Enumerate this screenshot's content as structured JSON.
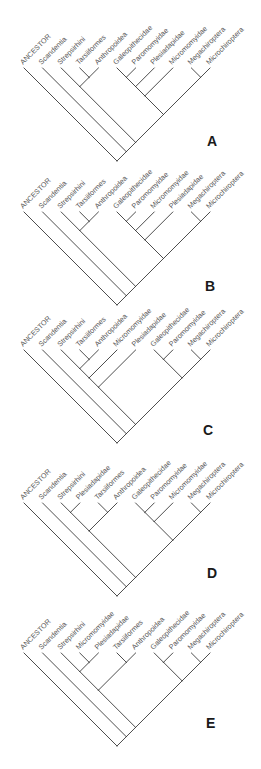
{
  "figure": {
    "colors": {
      "line": "#3a3a3a",
      "label": "#555555",
      "letter": "#1a1a1a",
      "background": "#ffffff"
    }
  },
  "panels": [
    {
      "letter": "A",
      "top": 0,
      "tip_y": 68,
      "letter_pos": [
        207,
        133
      ],
      "tips": [
        "ANCESTOR",
        "Scandentia",
        "Strepsirhini",
        "Tarsiiformes",
        "Anthropoidea",
        "Galeopithecidae",
        "Paromomyidae",
        "Plesiadapidae",
        "Micromomyidae",
        "Megachiroptera",
        "Microchiroptera"
      ],
      "tree": [
        0,
        [
          1,
          [
            [
              2,
              [
                3,
                4
              ]
            ],
            [
              [
                [
                  [
                    5,
                    6
                  ],
                  7
                ],
                8
              ],
              [
                9,
                10
              ]
            ]
          ]
        ]
      ]
    },
    {
      "letter": "B",
      "top": 145,
      "tip_y": 67,
      "letter_pos": [
        205,
        133
      ],
      "tips": [
        "ANCESTOR",
        "Scandentia",
        "Strepsirhini",
        "Tarsiiformes",
        "Anthropoidea",
        "Galeopithecidae",
        "Paromomyidae",
        "Micromomyidae",
        "Plesiadapidae",
        "Megachiroptera",
        "Microchiroptera"
      ],
      "tree": [
        0,
        [
          1,
          [
            [
              2,
              [
                3,
                4
              ]
            ],
            [
              [
                [
                  [
                    5,
                    6
                  ],
                  7
                ],
                8
              ],
              [
                9,
                10
              ]
            ]
          ]
        ]
      ]
    },
    {
      "letter": "C",
      "top": 292,
      "tip_y": 58,
      "letter_pos": [
        203,
        130
      ],
      "tips": [
        "ANCESTOR",
        "Scandentia",
        "Strepsirhini",
        "Tarsiiformes",
        "Anthropoidea",
        "Micromomyidae",
        "Plesiadapidae",
        "Galeopithecidae",
        "Paromomyidae",
        "Megachiroptera",
        "Microchiroptera"
      ],
      "tree": [
        0,
        [
          1,
          [
            [
              [
                [
                  2,
                  [
                    3,
                    4
                  ]
                ],
                5
              ],
              6
            ],
            [
              [
                7,
                8
              ],
              [
                9,
                10
              ]
            ]
          ]
        ]
      ]
    },
    {
      "letter": "D",
      "top": 445,
      "tip_y": 58,
      "letter_pos": [
        207,
        120
      ],
      "tips": [
        "ANCESTOR",
        "Scandentia",
        "Strepsirhini",
        "Plesiadapidae",
        "Tarsiiformes",
        "Anthropoidea",
        "Galeopithecidae",
        "Paromomyidae",
        "Micromomyidae",
        "Megachiroptera",
        "Microchiroptera"
      ],
      "tree": [
        0,
        [
          1,
          [
            [
              [
                2,
                3
              ],
              [
                4,
                5
              ]
            ],
            [
              [
                [
                  6,
                  7
                ],
                8
              ],
              [
                9,
                10
              ]
            ]
          ]
        ]
      ]
    },
    {
      "letter": "E",
      "top": 595,
      "tip_y": 58,
      "letter_pos": [
        206,
        120
      ],
      "tips": [
        "ANCESTOR",
        "Scandentia",
        "Strepsirhini",
        "Micromomyidae",
        "Plesiadapidae",
        "Tarsiiformes",
        "Anthropoidea",
        "Galeopithecidae",
        "Paromomyidae",
        "Megachiroptera",
        "Microchiroptera"
      ],
      "tree": [
        0,
        [
          1,
          [
            [
              [
                2,
                [
                  3,
                  4
                ]
              ],
              [
                5,
                6
              ]
            ],
            [
              [
                7,
                8
              ],
              [
                9,
                10
              ]
            ]
          ]
        ]
      ]
    }
  ]
}
